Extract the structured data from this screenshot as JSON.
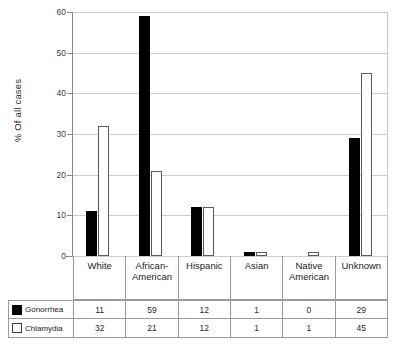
{
  "chart_data": {
    "type": "bar",
    "title": "",
    "xlabel": "",
    "ylabel": "% Of all cases",
    "ylim": [
      0,
      60
    ],
    "yticks": [
      0,
      10,
      20,
      30,
      40,
      50,
      60
    ],
    "grid": true,
    "legend_position": "table-left",
    "categories": [
      "White",
      "African-American",
      "Hispanic",
      "Asian",
      "Native American",
      "Unknown"
    ],
    "series": [
      {
        "name": "Gonorrhea",
        "values": [
          11,
          59,
          12,
          1,
          0,
          29
        ],
        "color": "#000000",
        "style": "filled"
      },
      {
        "name": "Chlamydia",
        "values": [
          32,
          21,
          12,
          1,
          1,
          45
        ],
        "color": "#ffffff",
        "style": "hollow"
      }
    ]
  },
  "axis": {
    "y_title": "% Of all cases",
    "ticks": [
      "60",
      "50",
      "40",
      "30",
      "20",
      "10",
      "0"
    ]
  },
  "table": {
    "categories": [
      {
        "line1": "White",
        "line2": ""
      },
      {
        "line1": "African-",
        "line2": "American"
      },
      {
        "line1": "Hispanic",
        "line2": ""
      },
      {
        "line1": "Asian",
        "line2": ""
      },
      {
        "line1": "Native",
        "line2": "American"
      },
      {
        "line1": "Unknown",
        "line2": ""
      }
    ],
    "rows": [
      {
        "label": "Gonorrhea",
        "swatch": "filled-square-icon",
        "values": [
          "11",
          "59",
          "12",
          "1",
          "0",
          "29"
        ]
      },
      {
        "label": "Chlamydia",
        "swatch": "hollow-square-icon",
        "values": [
          "32",
          "21",
          "12",
          "1",
          "1",
          "45"
        ]
      }
    ]
  },
  "colors": {
    "gonorrhea": "#000000",
    "chlamydia": "#ffffff",
    "gridline": "#cdcdcd",
    "axis": "#8a8a8a",
    "table_border": "#9a9a9a"
  }
}
